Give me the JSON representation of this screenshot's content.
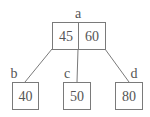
{
  "diagram": {
    "type": "b-tree",
    "root": {
      "label": "a",
      "keys": [
        "45",
        "60"
      ]
    },
    "children": [
      {
        "label": "b",
        "keys": [
          "40"
        ]
      },
      {
        "label": "c",
        "keys": [
          "50"
        ]
      },
      {
        "label": "d",
        "keys": [
          "80"
        ]
      }
    ],
    "colors": {
      "stroke": "#7a7a7a",
      "text": "#555555",
      "background": "#ffffff"
    }
  }
}
